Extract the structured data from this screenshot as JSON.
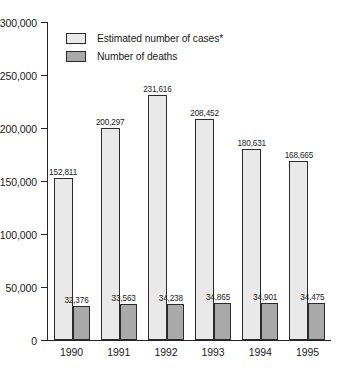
{
  "chart_data": {
    "type": "bar",
    "title": "",
    "subtitle": "",
    "xlabel": "",
    "ylabel": "",
    "categories": [
      "1990",
      "1991",
      "1992",
      "1993",
      "1994",
      "1995"
    ],
    "series": [
      {
        "name": "Estimated number of cases*",
        "values": [
          152811,
          200297,
          231616,
          208452,
          180631,
          168665
        ],
        "labels": [
          "152,811",
          "200,297",
          "231,616",
          "208,452",
          "180,631",
          "168,665"
        ],
        "color": "#e9e9e9"
      },
      {
        "name": "Number of deaths",
        "values": [
          32376,
          33563,
          34238,
          34865,
          34901,
          34475
        ],
        "labels": [
          "32,376",
          "33,563",
          "34,238",
          "34,865",
          "34,901",
          "34,475"
        ],
        "color": "#a9a9a9"
      }
    ],
    "ylim": [
      0,
      300000
    ],
    "ytick_values": [
      0,
      50000,
      100000,
      150000,
      200000,
      250000,
      300000
    ],
    "ytick_labels": [
      "0",
      "50,000",
      "100,000",
      "150,000",
      "200,000",
      "250,000",
      "300,000"
    ],
    "grid": false,
    "legend_position": "upper-left-inside",
    "axis_style": "left-spine-only"
  },
  "legend": {
    "items": [
      {
        "label": "Estimated number of cases*"
      },
      {
        "label": "Number of deaths"
      }
    ]
  }
}
